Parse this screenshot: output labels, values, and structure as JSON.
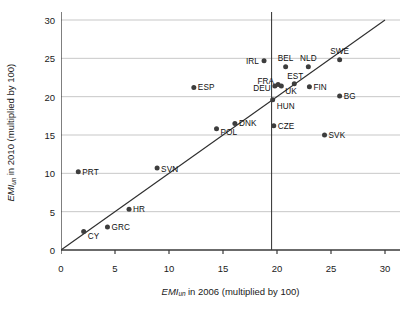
{
  "chart_data": {
    "type": "scatter",
    "title": "",
    "xlabel": "EMI_un in 2006 (multiplied by 100)",
    "ylabel": "EMI_un in 2010 (multiplied by 100)",
    "xlabel_parts": {
      "prefix": "EMI",
      "subscript": "un",
      "suffix": " in 2006 (multiplied by 100)"
    },
    "ylabel_parts": {
      "prefix": "EMI",
      "subscript": "un",
      "suffix": " in 2010 (multiplied by 100)"
    },
    "xlim": [
      0,
      30
    ],
    "ylim": [
      0,
      30
    ],
    "xticks": [
      0,
      5,
      10,
      15,
      20,
      25,
      30
    ],
    "yticks": [
      0,
      5,
      10,
      15,
      20,
      25,
      30
    ],
    "grid": "horizontal",
    "legend": "none",
    "reference_lines": [
      {
        "name": "identity-line",
        "kind": "diagonal",
        "from": [
          0,
          0
        ],
        "to": [
          30,
          30
        ]
      },
      {
        "name": "eu-average-vertical",
        "kind": "vertical",
        "x": 19.5
      }
    ],
    "marker_color": "#3d3d3d",
    "grid_color": "#b9b9b9",
    "axis_color": "#3a3a3a",
    "points": [
      {
        "label": "PRT",
        "x": 1.6,
        "y": 10.2,
        "anchor": "left"
      },
      {
        "label": "CY",
        "x": 2.1,
        "y": 2.4,
        "anchor": "left"
      },
      {
        "label": "GRC",
        "x": 4.3,
        "y": 3.0,
        "anchor": "left"
      },
      {
        "label": "HR",
        "x": 6.3,
        "y": 5.3,
        "anchor": "left"
      },
      {
        "label": "SVN",
        "x": 8.9,
        "y": 10.7,
        "anchor": "left"
      },
      {
        "label": "ESP",
        "x": 12.3,
        "y": 21.2,
        "anchor": "left"
      },
      {
        "label": "POL",
        "x": 14.4,
        "y": 15.8,
        "anchor": "left"
      },
      {
        "label": "DNK",
        "x": 16.1,
        "y": 16.5,
        "anchor": "left"
      },
      {
        "label": "IRL",
        "x": 18.8,
        "y": 24.7,
        "anchor": "right"
      },
      {
        "label": "HUN",
        "x": 19.6,
        "y": 19.6,
        "anchor": "left"
      },
      {
        "label": "CZE",
        "x": 19.7,
        "y": 16.2,
        "anchor": "left"
      },
      {
        "label": "DEU",
        "x": 19.8,
        "y": 21.4,
        "anchor": "right"
      },
      {
        "label": "FRA",
        "x": 20.1,
        "y": 21.6,
        "anchor": "right"
      },
      {
        "label": "UK",
        "x": 20.4,
        "y": 21.4,
        "anchor": "left"
      },
      {
        "label": "BEL",
        "x": 20.8,
        "y": 23.9,
        "anchor": "center"
      },
      {
        "label": "EST",
        "x": 21.6,
        "y": 21.7,
        "anchor": "center"
      },
      {
        "label": "NLD",
        "x": 22.9,
        "y": 23.9,
        "anchor": "center"
      },
      {
        "label": "FIN",
        "x": 23.0,
        "y": 21.3,
        "anchor": "left"
      },
      {
        "label": "SVK",
        "x": 24.4,
        "y": 15.0,
        "anchor": "left"
      },
      {
        "label": "SWE",
        "x": 25.8,
        "y": 24.8,
        "anchor": "center"
      },
      {
        "label": "BG",
        "x": 25.8,
        "y": 20.1,
        "anchor": "left"
      }
    ],
    "label_offsets": {
      "BEL": {
        "dx": 0,
        "dy": -9
      },
      "NLD": {
        "dx": 0,
        "dy": -9
      },
      "SWE": {
        "dx": 0,
        "dy": -9
      },
      "EST": {
        "dx": 1,
        "dy": -8
      },
      "FRA": {
        "dx": -4,
        "dy": -3
      },
      "DEU": {
        "dx": -4,
        "dy": 2
      },
      "UK": {
        "dx": 4,
        "dy": 5
      },
      "HUN": {
        "dx": 4,
        "dy": 6
      },
      "IRL": {
        "dx": -5,
        "dy": 0
      },
      "CY": {
        "dx": 4,
        "dy": 4
      },
      "SVN": {
        "dx": 4,
        "dy": 1
      },
      "POL": {
        "dx": 4,
        "dy": 3
      },
      "DNK": {
        "dx": 4,
        "dy": -1
      }
    }
  }
}
